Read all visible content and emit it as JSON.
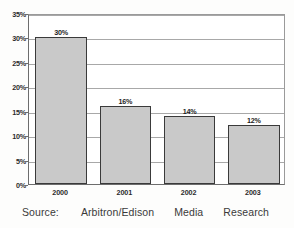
{
  "chart_data": {
    "type": "bar",
    "title": "",
    "xlabel": "",
    "ylabel": "",
    "categories": [
      "2000",
      "2001",
      "2002",
      "2003"
    ],
    "values": [
      30,
      16,
      14,
      12
    ],
    "value_labels": [
      "30%",
      "16%",
      "14%",
      "12%"
    ],
    "ylim": [
      0,
      35
    ],
    "ytick_values": [
      0,
      5,
      10,
      15,
      20,
      25,
      30,
      35
    ],
    "ytick_labels": [
      "0%",
      "5%",
      "10%",
      "15%",
      "20%",
      "25%",
      "30%",
      "35%"
    ],
    "grid": true,
    "legend": false,
    "series": [
      {
        "name": "",
        "values": [
          30,
          16,
          14,
          12
        ]
      }
    ],
    "colors": {
      "bar_fill": "#c9c9c9",
      "bar_border": "#3a3a3a",
      "gridline": "#a8a8a8",
      "axis": "#6d6d6d",
      "text": "#2b2b2b",
      "background": "#fdfdfc",
      "plot_background": "#ffffff"
    }
  },
  "caption": {
    "label": "Source:",
    "organization": "Arbitron/Edison",
    "media": "Media",
    "research": "Research",
    "full_text": "Source: Arbitron/Edison Media Research"
  }
}
